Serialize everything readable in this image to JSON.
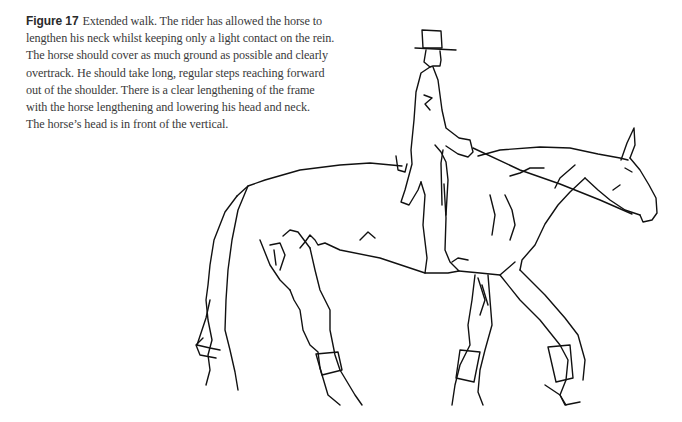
{
  "figure": {
    "label": "Figure 17",
    "caption_lines": [
      "Extended walk. The rider has allowed the horse to",
      "lengthen his neck whilst keeping only a light contact on the rein.",
      "The horse should cover as much ground as possible and clearly",
      "overtrack. He should take long, regular steps reaching forward",
      "out of the shoulder. There is a clear lengthening of the frame",
      "with the horse lengthening and lowering his head and neck.",
      "The horse’s head is in front of the vertical."
    ],
    "illustration": {
      "subject": "line drawing of a rider in top hat and tailcoat on a horse at extended walk",
      "style": "black ink line art on white"
    }
  }
}
